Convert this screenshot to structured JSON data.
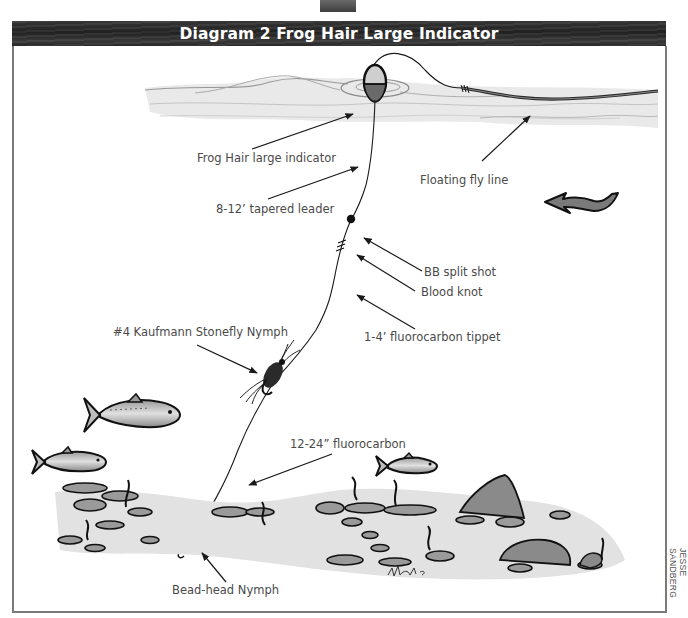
{
  "title": "Diagram 2 Frog Hair Large Indicator",
  "labels": {
    "indicator": "Frog Hair large indicator",
    "fly_line": "Floating fly line",
    "leader": "8-12’ tapered leader",
    "split_shot": "BB split shot",
    "blood_knot": "Blood knot",
    "tippet": "1-4’ fluorocarbon tippet",
    "stonefly": "#4 Kaufmann Stonefly Nymph",
    "fluorocarbon": "12-24” fluorocarbon",
    "bead_head": "Bead-head Nymph"
  },
  "credit": "JESSE SANDBERG",
  "icons": {
    "current_direction": "wavy-arrow-left-icon"
  },
  "colors": {
    "title_bar": "#2a2a2a",
    "frame": "#7a7a7a",
    "label_text": "#4a4a4a",
    "ink": "#1a1a1a"
  }
}
